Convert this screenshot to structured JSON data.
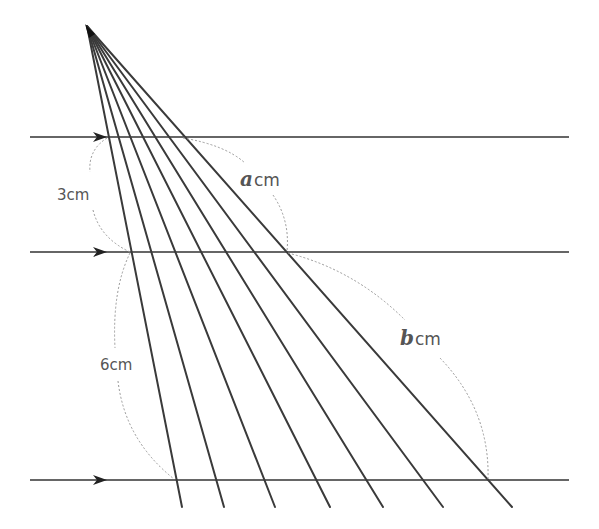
{
  "diagram": {
    "colors": {
      "line": "#333333",
      "ray": "#3a3a3a",
      "arc": "#999999",
      "text": "#555555"
    },
    "apex": {
      "x": 87,
      "y": 26
    },
    "parallel_lines": [
      {
        "id": "top",
        "y": 137,
        "x1": 30,
        "x2": 569,
        "arrow_x": 103
      },
      {
        "id": "middle",
        "y": 252,
        "x1": 30,
        "x2": 569,
        "arrow_x": 103
      },
      {
        "id": "bottom",
        "y": 480,
        "x1": 30,
        "x2": 569,
        "arrow_x": 103
      }
    ],
    "rays": [
      {
        "end": {
          "x": 182,
          "y": 507
        }
      },
      {
        "end": {
          "x": 224,
          "y": 507
        }
      },
      {
        "end": {
          "x": 275,
          "y": 507
        }
      },
      {
        "end": {
          "x": 330,
          "y": 507
        }
      },
      {
        "end": {
          "x": 383,
          "y": 507
        }
      },
      {
        "end": {
          "x": 443,
          "y": 507
        }
      },
      {
        "end": {
          "x": 512,
          "y": 507
        }
      }
    ],
    "labels": {
      "left_top": {
        "number": "3",
        "unit": "cm"
      },
      "left_bottom": {
        "number": "6",
        "unit": "cm"
      },
      "right_top": {
        "variable": "a",
        "unit": "cm"
      },
      "right_bottom": {
        "variable": "b",
        "unit": "cm"
      }
    }
  }
}
